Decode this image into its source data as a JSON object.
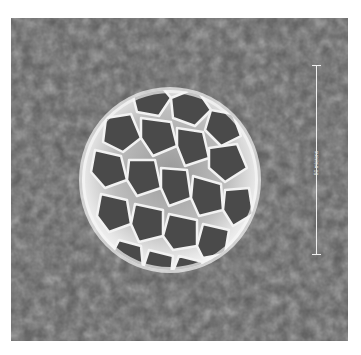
{
  "image": {
    "subject": "pollen grain (scanning electron micrograph)",
    "background_color": "#5a5a5a",
    "grain_color": "#d8d8d8"
  },
  "scale_bar": {
    "label": "50 microns",
    "orientation": "vertical",
    "color": "#f0f0f0"
  }
}
